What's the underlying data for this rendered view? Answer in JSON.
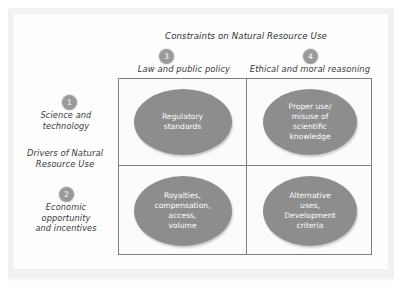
{
  "figure": {
    "title": "Constraints on Natural Resource Use",
    "row_axis_label": "Drivers of Natural\nResource Use",
    "colors": {
      "ellipse_fill": "#8d8d8d",
      "badge_fill": "#9a9a9a",
      "grid_line": "#7e7e86",
      "text": "#3a3a3a",
      "ellipse_text": "#ffffff",
      "frame": "#f1f1f1"
    },
    "columns": [
      {
        "badge": "3",
        "label": "Law and public policy"
      },
      {
        "badge": "4",
        "label": "Ethical and moral reasoning"
      }
    ],
    "rows": [
      {
        "badge": "1",
        "label": "Science and\ntechnology"
      },
      {
        "badge": "2",
        "label": "Economic\nopportunity\nand incentives"
      }
    ],
    "cells": [
      {
        "row": 1,
        "col": 3,
        "text": "Regulatory\nstandards"
      },
      {
        "row": 1,
        "col": 4,
        "text": "Proper use/\nmisuse of\nscientific\nknowledge"
      },
      {
        "row": 2,
        "col": 3,
        "text": "Royalties,\ncompensation,\naccess,\nvolume"
      },
      {
        "row": 2,
        "col": 4,
        "text": "Alternative\nuses,\nDevelopment\ncriteria"
      }
    ]
  },
  "chart_data": {
    "type": "table",
    "title": "Constraints on Natural Resource Use",
    "xlabel": "Constraints on Natural Resource Use",
    "ylabel": "Drivers of Natural Resource Use",
    "categories": [
      "Law and public policy",
      "Ethical and moral reasoning"
    ],
    "row_categories": [
      "Science and technology",
      "Economic opportunity and incentives"
    ],
    "grid": true,
    "legend": "none",
    "series": [
      {
        "name": "Science and technology",
        "values": [
          "Regulatory standards",
          "Proper use/ misuse of scientific knowledge"
        ]
      },
      {
        "name": "Economic opportunity and incentives",
        "values": [
          "Royalties, compensation, access, volume",
          "Alternative uses, Development criteria"
        ]
      }
    ],
    "annotations": [
      {
        "marker": "1",
        "text": "Science and technology"
      },
      {
        "marker": "2",
        "text": "Economic opportunity and incentives"
      },
      {
        "marker": "3",
        "text": "Law and public policy"
      },
      {
        "marker": "4",
        "text": "Ethical and moral reasoning"
      }
    ]
  }
}
